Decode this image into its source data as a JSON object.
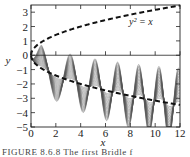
{
  "chart_data": {
    "type": "line",
    "title": "",
    "xlabel": "x",
    "ylabel": "y",
    "xlim": [
      0,
      12
    ],
    "ylim": [
      -5,
      3.5
    ],
    "xticks": [
      0,
      2,
      4,
      6,
      8,
      10,
      12
    ],
    "yticks": [
      3,
      2,
      1,
      0,
      -1,
      -2,
      -3,
      -4,
      -5
    ],
    "grid": false,
    "legend": "none",
    "annotations": [
      {
        "text": "y² = x",
        "x": 7.9,
        "y": 2.1
      }
    ],
    "series": [
      {
        "name": "y = sqrt(x)",
        "style": "dashed",
        "color": "#111111",
        "formula": "sqrt(x)"
      },
      {
        "name": "y = -sqrt(x)",
        "style": "dashed",
        "color": "#111111",
        "formula": "-sqrt(x)"
      },
      {
        "name": "solution family",
        "style": "solid-thin",
        "color": "#555555",
        "count": 22,
        "description": "nested oscillating solution curves starting at origin, oscillating about y = -sqrt(x) with growing lobes"
      }
    ],
    "reference_line": {
      "y": 0,
      "style": "solid"
    }
  },
  "caption": "FIGURE 8.6.8  The first Bridle f"
}
